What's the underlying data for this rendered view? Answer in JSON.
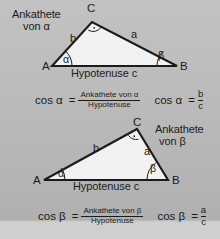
{
  "page": {
    "background_color": "#bbbbbb",
    "ink_color": "#1b1b1b",
    "triangle_fill": "#f2f2f2"
  },
  "figure_top": {
    "caption_ankathete": "Ankathete",
    "caption_von": "von α",
    "vertex_a": "A",
    "vertex_b": "B",
    "vertex_c": "C",
    "side_a": "a",
    "side_b": "b",
    "angle_alpha": "α",
    "angle_beta": "β",
    "hypotenuse": "Hypotenuse c"
  },
  "figure_bottom": {
    "caption_ankathete": "Ankathete",
    "caption_von": "von β",
    "vertex_a": "A",
    "vertex_b": "B",
    "vertex_c": "C",
    "side_a": "a",
    "side_b": "b",
    "angle_alpha": "α",
    "angle_beta": "β",
    "hypotenuse": "Hypotenuse c"
  },
  "formula_alpha": {
    "lhs": "cos α",
    "equals": "=",
    "numerator": "Ankathete von α",
    "denominator": "Hypotenuse",
    "short_lhs": "cos α",
    "short_equals": "=",
    "short_numerator": "b",
    "short_denominator": "c"
  },
  "formula_beta": {
    "lhs": "cos β",
    "equals": "=",
    "numerator": "Ankathete von β",
    "denominator": "Hypotenuse",
    "short_lhs": "cos β",
    "short_equals": "=",
    "short_numerator": "a",
    "short_denominator": "c"
  }
}
